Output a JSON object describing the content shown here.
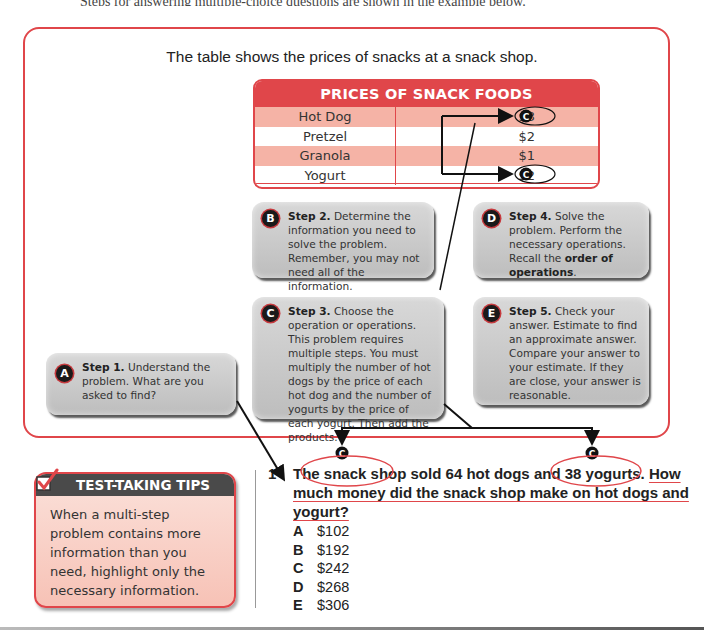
{
  "top_cut_text": "Steps for answering multiple-choice questions are shown in the example below.",
  "intro": "The table shows the prices of snacks at a snack shop.",
  "table": {
    "title": "PRICES OF SNACK FOODS",
    "rows": [
      {
        "name": "Hot Dog",
        "price": "$3",
        "marked": true
      },
      {
        "name": "Pretzel",
        "price": "$2",
        "marked": false
      },
      {
        "name": "Granola",
        "price": "$1",
        "marked": false
      },
      {
        "name": "Yogurt",
        "price": "$2",
        "marked": true
      }
    ],
    "marker_label": "C"
  },
  "steps": {
    "a": {
      "badge": "A",
      "title": "Step 1.",
      "text": " Understand the problem. What are you asked to find?"
    },
    "b": {
      "badge": "B",
      "title": "Step 2.",
      "text": " Determine the information you need to solve the problem. Remember, you may not need all of the information."
    },
    "c": {
      "badge": "C",
      "title": "Step 3.",
      "text": " Choose the operation or operations. This problem requires multiple steps. You must multiply the number of hot dogs by the price of each hot dog and the number of yogurts by the price of each yogurt. Then add the products."
    },
    "d": {
      "badge": "D",
      "title": "Step 4.",
      "text": " Solve the problem. Perform the necessary operations. Recall the ",
      "bold_tail": "order of operations",
      "end": "."
    },
    "e": {
      "badge": "E",
      "title": "Step 5.",
      "text": " Check your answer. Estimate to find an approximate answer. Compare your answer to your estimate. If they are close, your answer is reasonable."
    }
  },
  "tips": {
    "heading": "TEST-TAKING TIPS",
    "body": "When a multi-step problem contains more information than you need, highlight only the necessary information."
  },
  "question": {
    "number": "1",
    "part1": "The snack shop sold ",
    "highlight1": "64 hot dogs",
    "part2": " and ",
    "highlight2": "38 yogurts.",
    "part3": " ",
    "underlined": "How much money did the snack shop make on hot dogs and yogurt?",
    "choices": [
      {
        "letter": "A",
        "value": "$102"
      },
      {
        "letter": "B",
        "value": "$192"
      },
      {
        "letter": "C",
        "value": "$242"
      },
      {
        "letter": "D",
        "value": "$268"
      },
      {
        "letter": "E",
        "value": "$306"
      }
    ]
  },
  "colors": {
    "accent": "#e0464a",
    "step_gray": "#c8c8c8",
    "tip_header": "#4a4a4a"
  }
}
